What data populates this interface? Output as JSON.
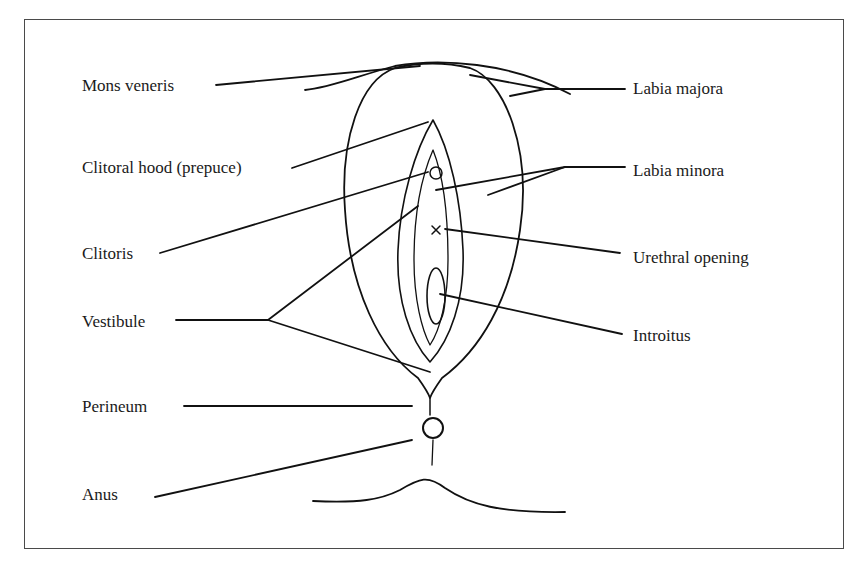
{
  "diagram": {
    "type": "anatomical-labeled-diagram",
    "left_labels": [
      {
        "id": "mons-veneris",
        "text": "Mons veneris",
        "x": 82,
        "y": 76
      },
      {
        "id": "clitoral-hood",
        "text": "Clitoral hood (prepuce)",
        "x": 82,
        "y": 158
      },
      {
        "id": "clitoris",
        "text": "Clitoris",
        "x": 82,
        "y": 244
      },
      {
        "id": "vestibule",
        "text": "Vestibule",
        "x": 82,
        "y": 312
      },
      {
        "id": "perineum",
        "text": "Perineum",
        "x": 82,
        "y": 397
      },
      {
        "id": "anus",
        "text": "Anus",
        "x": 82,
        "y": 485
      }
    ],
    "right_labels": [
      {
        "id": "labia-majora",
        "text": "Labia majora",
        "x": 633,
        "y": 79
      },
      {
        "id": "labia-minora",
        "text": "Labia minora",
        "x": 633,
        "y": 161
      },
      {
        "id": "urethral-opening",
        "text": "Urethral opening",
        "x": 633,
        "y": 248
      },
      {
        "id": "introitus",
        "text": "Introitus",
        "x": 633,
        "y": 326
      }
    ],
    "line_color": "#111111",
    "frame_color": "#4a4a4a"
  }
}
